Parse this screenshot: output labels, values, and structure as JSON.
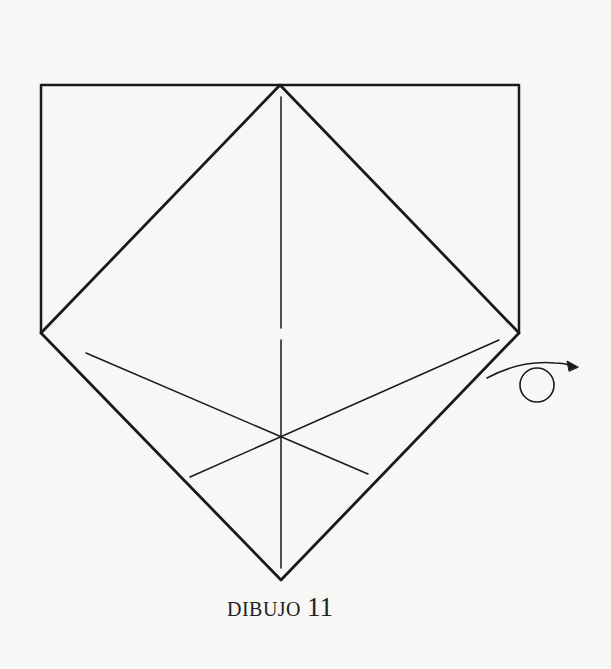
{
  "figure": {
    "caption_word": "DIBUJO",
    "caption_number": "11",
    "stroke_color": "#1a1a1a",
    "background": "#f7f7f5"
  },
  "diagram": {
    "type": "origami-fold-diagram",
    "shapes": {
      "outer_pentagon": "top edge 41-519 at y=85, sides down to y=333, point at (281,580)",
      "inner_diamond": "apex (280,85), corners (41,333),(519,333), bottom (281,580)",
      "center_crease": "vertical dashed crease x=281",
      "diagonal_creases": 2,
      "turn_over_symbol": "circle with curved arrow"
    }
  }
}
